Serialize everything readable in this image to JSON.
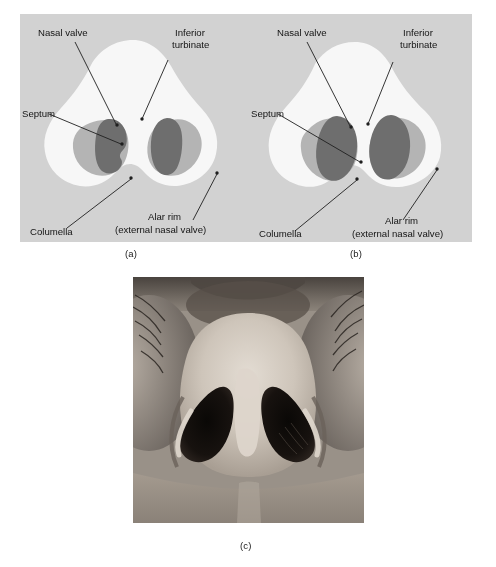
{
  "figure": {
    "type": "medical-anatomy-figure",
    "panels": [
      {
        "id": "a",
        "caption": "(a)",
        "kind": "diagram",
        "variant": "narrow-slit-nostrils",
        "labels": [
          {
            "key": "nasal_valve",
            "text": "Nasal valve",
            "name": "label-nasal-valve"
          },
          {
            "key": "inferior_1",
            "text": "Inferior",
            "name": "label-inferior-turbinate-line1"
          },
          {
            "key": "inferior_2",
            "text": "turbinate",
            "name": "label-inferior-turbinate-line2"
          },
          {
            "key": "septum",
            "text": "Septum",
            "name": "label-septum"
          },
          {
            "key": "columella",
            "text": "Columella",
            "name": "label-columella"
          },
          {
            "key": "alar_1",
            "text": "Alar rim",
            "name": "label-alar-rim-line1"
          },
          {
            "key": "alar_2",
            "text": "(external nasal valve)",
            "name": "label-alar-rim-line2"
          }
        ]
      },
      {
        "id": "b",
        "caption": "(b)",
        "kind": "diagram",
        "variant": "round-oval-nostrils",
        "labels": [
          {
            "key": "nasal_valve",
            "text": "Nasal valve",
            "name": "label-nasal-valve"
          },
          {
            "key": "inferior_1",
            "text": "Inferior",
            "name": "label-inferior-turbinate-line1"
          },
          {
            "key": "inferior_2",
            "text": "turbinate",
            "name": "label-inferior-turbinate-line2"
          },
          {
            "key": "septum",
            "text": "Septum",
            "name": "label-septum"
          },
          {
            "key": "columella",
            "text": "Columella",
            "name": "label-columella"
          },
          {
            "key": "alar_1",
            "text": "Alar rim",
            "name": "label-alar-rim-line1"
          },
          {
            "key": "alar_2",
            "text": "(external nasal valve)",
            "name": "label-alar-rim-line2"
          }
        ]
      },
      {
        "id": "c",
        "caption": "(c)",
        "kind": "photograph",
        "subject": "basal view of human nose showing both nostrils"
      }
    ]
  },
  "colors": {
    "panel_background": "#d2d2d2",
    "nose_body": "#f7f7f7",
    "septum_region": "#b4b4b4",
    "turbinate_region": "#6e6e6e",
    "leader_line": "#1f1f1f",
    "text": "#141414",
    "page_background": "#ffffff",
    "photo_skin_light": "#cfc7be",
    "photo_nostril_dark": "#17120f"
  }
}
